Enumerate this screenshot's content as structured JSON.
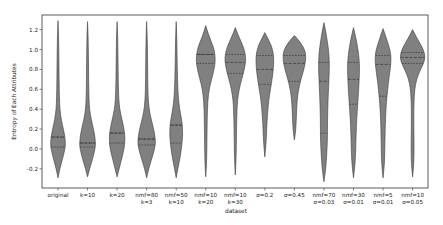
{
  "chart_data": {
    "type": "violin",
    "title": "",
    "xlabel": "dataset",
    "ylabel": "Entropy of Each Attributes",
    "ylim": [
      -0.36,
      1.34
    ],
    "yticks": [
      -0.2,
      0.0,
      0.2,
      0.4,
      0.6,
      0.8,
      1.0,
      1.2
    ],
    "ytick_labels": [
      "-0.2",
      "0.0",
      "0.2",
      "0.4",
      "0.6",
      "0.8",
      "1.0",
      "1.2"
    ],
    "grid": false,
    "legend": null,
    "fill_color": "#808080",
    "edge_color": "#3a3a3a",
    "inner": "quartile",
    "categories": [
      [
        "original"
      ],
      [
        "k=10"
      ],
      [
        "k=20"
      ],
      [
        "nmf=80",
        "k=3"
      ],
      [
        "nmf=50",
        "k=10"
      ],
      [
        "nmf=10",
        "k=20"
      ],
      [
        "nmf=10",
        "k=30"
      ],
      [
        "σ=0.2"
      ],
      [
        "σ=0.45"
      ],
      [
        "nmf=70",
        "σ=0.03"
      ],
      [
        "nmf=30",
        "σ=0.01"
      ],
      [
        "nmf=5",
        "σ=0.01"
      ],
      [
        "nmf=10",
        "σ=0.05"
      ]
    ],
    "series": [
      {
        "name": "original",
        "min": -0.29,
        "max": 1.29,
        "q1": 0.02,
        "median": 0.12,
        "q3": 0.12,
        "mode": 0.06,
        "max_half_width": 7.5,
        "profile": [
          [
            -0.29,
            0
          ],
          [
            -0.2,
            1.8
          ],
          [
            -0.1,
            4.5
          ],
          [
            0.0,
            7
          ],
          [
            0.06,
            7.5
          ],
          [
            0.15,
            6.5
          ],
          [
            0.25,
            4.2
          ],
          [
            0.35,
            2.4
          ],
          [
            0.45,
            1.6
          ],
          [
            0.6,
            1.2
          ],
          [
            0.8,
            1.0
          ],
          [
            1.0,
            0.8
          ],
          [
            1.15,
            0.5
          ],
          [
            1.29,
            0
          ]
        ]
      },
      {
        "name": "k=10",
        "min": -0.28,
        "max": 1.28,
        "q1": 0.02,
        "median": 0.06,
        "q3": 0.06,
        "mode": 0.06,
        "max_half_width": 8,
        "profile": [
          [
            -0.28,
            0
          ],
          [
            -0.2,
            2
          ],
          [
            -0.1,
            5
          ],
          [
            0.0,
            7.5
          ],
          [
            0.06,
            8
          ],
          [
            0.15,
            7
          ],
          [
            0.25,
            4.8
          ],
          [
            0.35,
            2.6
          ],
          [
            0.45,
            1.6
          ],
          [
            0.6,
            1.2
          ],
          [
            0.8,
            1.0
          ],
          [
            1.0,
            0.8
          ],
          [
            1.15,
            0.5
          ],
          [
            1.28,
            0
          ]
        ]
      },
      {
        "name": "k=20",
        "min": -0.28,
        "max": 1.28,
        "q1": 0.06,
        "median": 0.16,
        "q3": 0.16,
        "mode": 0.1,
        "max_half_width": 8,
        "profile": [
          [
            -0.28,
            0
          ],
          [
            -0.2,
            2
          ],
          [
            -0.1,
            4.5
          ],
          [
            0.0,
            7
          ],
          [
            0.1,
            8
          ],
          [
            0.2,
            7
          ],
          [
            0.3,
            4.8
          ],
          [
            0.4,
            2.6
          ],
          [
            0.5,
            1.7
          ],
          [
            0.6,
            1.3
          ],
          [
            0.8,
            1.0
          ],
          [
            1.0,
            0.8
          ],
          [
            1.15,
            0.5
          ],
          [
            1.28,
            0
          ]
        ]
      },
      {
        "name": "nmf=80 k=3",
        "min": -0.29,
        "max": 1.28,
        "q1": 0.04,
        "median": 0.1,
        "q3": 0.1,
        "mode": 0.08,
        "max_half_width": 9,
        "profile": [
          [
            -0.29,
            0
          ],
          [
            -0.2,
            2
          ],
          [
            -0.1,
            5
          ],
          [
            0.0,
            8
          ],
          [
            0.08,
            9
          ],
          [
            0.18,
            7.5
          ],
          [
            0.28,
            5
          ],
          [
            0.38,
            2.8
          ],
          [
            0.48,
            1.7
          ],
          [
            0.6,
            1.2
          ],
          [
            0.8,
            1.0
          ],
          [
            1.0,
            0.8
          ],
          [
            1.15,
            0.5
          ],
          [
            1.28,
            0
          ]
        ]
      },
      {
        "name": "nmf=50 k=10",
        "min": -0.29,
        "max": 1.28,
        "q1": 0.06,
        "median": 0.24,
        "q3": 0.24,
        "mode": 0.16,
        "max_half_width": 6.5,
        "profile": [
          [
            -0.29,
            0
          ],
          [
            -0.2,
            1.6
          ],
          [
            -0.1,
            3.6
          ],
          [
            0.0,
            5.2
          ],
          [
            0.1,
            6.2
          ],
          [
            0.16,
            6.5
          ],
          [
            0.26,
            6
          ],
          [
            0.36,
            4.2
          ],
          [
            0.46,
            2.6
          ],
          [
            0.6,
            1.6
          ],
          [
            0.8,
            1.1
          ],
          [
            1.0,
            0.8
          ],
          [
            1.15,
            0.5
          ],
          [
            1.28,
            0
          ]
        ]
      },
      {
        "name": "nmf=10 k=20",
        "min": -0.28,
        "max": 1.24,
        "q1": 0.86,
        "median": 0.95,
        "q3": 0.95,
        "mode": 0.91,
        "max_half_width": 9.5,
        "profile": [
          [
            -0.28,
            0
          ],
          [
            -0.15,
            0.8
          ],
          [
            0.0,
            1.1
          ],
          [
            0.2,
            1.3
          ],
          [
            0.4,
            1.6
          ],
          [
            0.55,
            2.6
          ],
          [
            0.65,
            4.5
          ],
          [
            0.75,
            7.2
          ],
          [
            0.85,
            9.2
          ],
          [
            0.91,
            9.5
          ],
          [
            1.0,
            8.5
          ],
          [
            1.08,
            5.5
          ],
          [
            1.16,
            2.4
          ],
          [
            1.24,
            0
          ]
        ]
      },
      {
        "name": "nmf=10 k=30",
        "min": -0.26,
        "max": 1.22,
        "q1": 0.76,
        "median": 0.87,
        "q3": 0.95,
        "mode": 0.92,
        "max_half_width": 10.5,
        "profile": [
          [
            -0.26,
            0
          ],
          [
            -0.1,
            0.8
          ],
          [
            0.1,
            1.1
          ],
          [
            0.3,
            1.4
          ],
          [
            0.45,
            1.9
          ],
          [
            0.55,
            3
          ],
          [
            0.65,
            5
          ],
          [
            0.75,
            7.8
          ],
          [
            0.85,
            10
          ],
          [
            0.92,
            10.5
          ],
          [
            1.0,
            9
          ],
          [
            1.08,
            5.8
          ],
          [
            1.15,
            2.6
          ],
          [
            1.22,
            0
          ]
        ]
      },
      {
        "name": "σ=0.2",
        "min": -0.08,
        "max": 1.17,
        "q1": 0.65,
        "median": 0.8,
        "q3": 0.94,
        "mode": 0.91,
        "max_half_width": 9,
        "profile": [
          [
            -0.08,
            0
          ],
          [
            0.05,
            1.2
          ],
          [
            0.2,
            1.8
          ],
          [
            0.35,
            2.6
          ],
          [
            0.5,
            4
          ],
          [
            0.6,
            5.6
          ],
          [
            0.7,
            7.2
          ],
          [
            0.8,
            8.5
          ],
          [
            0.9,
            9
          ],
          [
            0.98,
            8.2
          ],
          [
            1.05,
            6
          ],
          [
            1.11,
            3
          ],
          [
            1.17,
            0
          ]
        ]
      },
      {
        "name": "σ=0.45",
        "min": 0.09,
        "max": 1.14,
        "q1": 0.68,
        "median": 0.86,
        "q3": 0.94,
        "mode": 0.94,
        "max_half_width": 11.5,
        "profile": [
          [
            0.09,
            0
          ],
          [
            0.2,
            1.5
          ],
          [
            0.35,
            2
          ],
          [
            0.5,
            2.8
          ],
          [
            0.6,
            4.2
          ],
          [
            0.7,
            6.5
          ],
          [
            0.8,
            9.5
          ],
          [
            0.9,
            11.5
          ],
          [
            0.98,
            11
          ],
          [
            1.04,
            8
          ],
          [
            1.09,
            4.5
          ],
          [
            1.14,
            0
          ]
        ]
      },
      {
        "name": "nmf=70 σ=0.03",
        "min": -0.33,
        "max": 1.27,
        "q1": 0.16,
        "median": 0.68,
        "q3": 0.87,
        "mode": 0.85,
        "max_half_width": 5.5,
        "profile": [
          [
            -0.33,
            0
          ],
          [
            -0.2,
            1.8
          ],
          [
            -0.05,
            2.8
          ],
          [
            0.1,
            3.5
          ],
          [
            0.25,
            3.5
          ],
          [
            0.4,
            3.8
          ],
          [
            0.55,
            4.3
          ],
          [
            0.7,
            5
          ],
          [
            0.85,
            5.5
          ],
          [
            0.98,
            4.8
          ],
          [
            1.08,
            3.4
          ],
          [
            1.18,
            1.8
          ],
          [
            1.27,
            0
          ]
        ]
      },
      {
        "name": "nmf=30 σ=0.01",
        "min": -0.29,
        "max": 1.22,
        "q1": 0.45,
        "median": 0.7,
        "q3": 0.87,
        "mode": 0.82,
        "max_half_width": 6,
        "profile": [
          [
            -0.29,
            0
          ],
          [
            -0.15,
            1.6
          ],
          [
            0.0,
            2.2
          ],
          [
            0.15,
            2.6
          ],
          [
            0.3,
            3.2
          ],
          [
            0.45,
            4.2
          ],
          [
            0.6,
            5.2
          ],
          [
            0.75,
            5.9
          ],
          [
            0.85,
            6
          ],
          [
            0.97,
            5
          ],
          [
            1.07,
            3.3
          ],
          [
            1.15,
            1.6
          ],
          [
            1.22,
            0
          ]
        ]
      },
      {
        "name": "nmf=5 σ=0.01",
        "min": -0.29,
        "max": 1.21,
        "q1": 0.53,
        "median": 0.85,
        "q3": 0.94,
        "mode": 0.9,
        "max_half_width": 8,
        "profile": [
          [
            -0.29,
            0
          ],
          [
            -0.15,
            1.4
          ],
          [
            0.0,
            1.8
          ],
          [
            0.15,
            2
          ],
          [
            0.3,
            2.4
          ],
          [
            0.45,
            3.2
          ],
          [
            0.6,
            4.6
          ],
          [
            0.72,
            6
          ],
          [
            0.82,
            7.4
          ],
          [
            0.9,
            8
          ],
          [
            0.98,
            7.4
          ],
          [
            1.06,
            5
          ],
          [
            1.14,
            2.4
          ],
          [
            1.21,
            0
          ]
        ]
      },
      {
        "name": "nmf=10 σ=0.05",
        "min": -0.28,
        "max": 1.2,
        "q1": 0.86,
        "median": 0.92,
        "q3": 0.97,
        "mode": 0.92,
        "max_half_width": 12.5,
        "profile": [
          [
            -0.28,
            0
          ],
          [
            -0.15,
            1.2
          ],
          [
            0.0,
            1.5
          ],
          [
            0.15,
            1.3
          ],
          [
            0.3,
            1.2
          ],
          [
            0.45,
            1.3
          ],
          [
            0.6,
            2
          ],
          [
            0.7,
            4
          ],
          [
            0.78,
            7
          ],
          [
            0.86,
            11
          ],
          [
            0.92,
            12.5
          ],
          [
            0.99,
            11.2
          ],
          [
            1.06,
            7.5
          ],
          [
            1.13,
            3.5
          ],
          [
            1.2,
            0
          ]
        ]
      }
    ]
  },
  "layout": {
    "plot": {
      "left": 42,
      "right": 428,
      "top": 15,
      "bottom": 188
    },
    "y0_px": 149,
    "px_per_unit": 99.5,
    "first_center": 58,
    "spacing": 29.55
  }
}
